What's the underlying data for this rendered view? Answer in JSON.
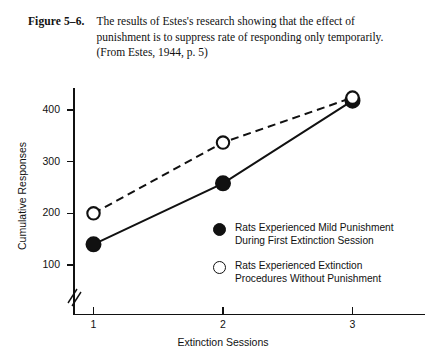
{
  "caption": {
    "label": "Figure 5–6.",
    "lines": [
      "The results of Estes's research showing that the effect of",
      "punishment is to suppress rate of responding only temporarily.",
      "(From Estes, 1944, p. 5)"
    ]
  },
  "chart_data": {
    "type": "line",
    "title": "",
    "xlabel": "Extinction Sessions",
    "ylabel": "Cumulative Responses",
    "x": [
      1,
      2,
      3
    ],
    "xticklabels": [
      "1",
      "2",
      "3"
    ],
    "yticks": [
      100,
      200,
      300,
      400
    ],
    "yticklabels": [
      "100",
      "200",
      "300",
      "400"
    ],
    "ylim": [
      75,
      440
    ],
    "xlim": [
      0.55,
      3.6
    ],
    "grid": false,
    "y_axis_break": true,
    "legend_position": "center-right-inside",
    "series": [
      {
        "name": "Rats Experienced Mild Punishment During First Extinction Session",
        "marker": "filled-circle",
        "linestyle": "solid",
        "color": "#111111",
        "values": [
          140,
          258,
          418
        ]
      },
      {
        "name": "Rats Experienced Extinction Procedures Without Punishment",
        "marker": "open-circle",
        "linestyle": "dashed",
        "color": "#111111",
        "values": [
          200,
          337,
          424
        ]
      }
    ]
  },
  "legend": [
    {
      "marker": "filled-circle",
      "lines": [
        "Rats Experienced Mild Punishment",
        "During First Extinction Session"
      ]
    },
    {
      "marker": "open-circle",
      "lines": [
        "Rats Experienced Extinction",
        "Procedures Without Punishment"
      ]
    }
  ],
  "colors": {
    "ink": "#111111",
    "background": "#ffffff"
  }
}
